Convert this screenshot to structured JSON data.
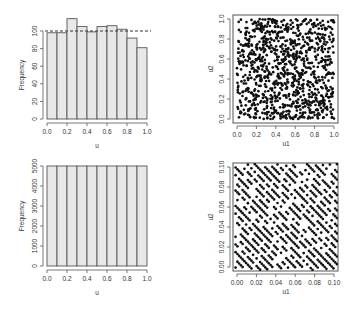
{
  "chart_data": [
    {
      "type": "bar",
      "panel": "top-left",
      "title": "",
      "xlabel": "u",
      "ylabel": "Frequency",
      "bin_edges": [
        0.0,
        0.1,
        0.2,
        0.3,
        0.4,
        0.5,
        0.6,
        0.7,
        0.8,
        0.9,
        1.0
      ],
      "categories": [
        "0.0-0.1",
        "0.1-0.2",
        "0.2-0.3",
        "0.3-0.4",
        "0.4-0.5",
        "0.5-0.6",
        "0.6-0.7",
        "0.7-0.8",
        "0.8-0.9",
        "0.9-1.0"
      ],
      "values": [
        98,
        98,
        114,
        105,
        99,
        105,
        106,
        102,
        92,
        81
      ],
      "reference_line": {
        "y": 100,
        "style": "dashed"
      },
      "xticks": [
        "0.0",
        "0.2",
        "0.4",
        "0.6",
        "0.8",
        "1.0"
      ],
      "yticks": [
        "0",
        "20",
        "40",
        "60",
        "80",
        "100"
      ],
      "xlim": [
        0,
        1
      ],
      "ylim": [
        0,
        114
      ],
      "grid": false,
      "bar_fill": "#e8e8e8",
      "bar_edge": "#555555"
    },
    {
      "type": "scatter",
      "panel": "top-right",
      "title": "",
      "xlabel": "u1",
      "ylabel": "u2",
      "description": "about 1000 points uniformly scattered over the unit square",
      "n_points": 1000,
      "generator_seed": 12345,
      "xticks": [
        "0.0",
        "0.2",
        "0.4",
        "0.6",
        "0.8",
        "1.0"
      ],
      "yticks": [
        "0.0",
        "0.2",
        "0.4",
        "0.6",
        "0.8",
        "1.0"
      ],
      "xlim": [
        0,
        1
      ],
      "ylim": [
        0,
        1
      ],
      "grid": false,
      "point_color": "#111111"
    },
    {
      "type": "bar",
      "panel": "bottom-left",
      "title": "",
      "xlabel": "u",
      "ylabel": "Frequency",
      "bin_edges": [
        0.0,
        0.1,
        0.2,
        0.3,
        0.4,
        0.5,
        0.6,
        0.7,
        0.8,
        0.9,
        1.0
      ],
      "categories": [
        "0.0-0.1",
        "0.1-0.2",
        "0.2-0.3",
        "0.3-0.4",
        "0.4-0.5",
        "0.5-0.6",
        "0.6-0.7",
        "0.7-0.8",
        "0.8-0.9",
        "0.9-1.0"
      ],
      "values": [
        5000,
        5000,
        5000,
        5000,
        5000,
        5000,
        5000,
        5000,
        5000,
        5000
      ],
      "xticks": [
        "0.0",
        "0.2",
        "0.4",
        "0.6",
        "0.8",
        "1.0"
      ],
      "yticks": [
        "0",
        "1000",
        "2000",
        "3000",
        "4000",
        "5000"
      ],
      "xlim": [
        0,
        1
      ],
      "ylim": [
        0,
        5000
      ],
      "grid": false,
      "bar_fill": "#e8e8e8",
      "bar_edge": "#555555"
    },
    {
      "type": "scatter",
      "panel": "bottom-right",
      "title": "",
      "xlabel": "u1",
      "ylabel": "u2",
      "description": "points lie on parallel diagonal lines (slope about -1), lattice structure of a generator zoomed to [0,0.1]x[0,0.1]",
      "lattice": {
        "line_spacing": 0.0077,
        "slope": -1,
        "point_step": 0.0018,
        "gap_probability": 0.25
      },
      "xticks": [
        "0.00",
        "0.02",
        "0.04",
        "0.06",
        "0.08",
        "0.10"
      ],
      "yticks": [
        "0.00",
        "0.02",
        "0.04",
        "0.06",
        "0.08",
        "0.10"
      ],
      "xlim": [
        0,
        0.1
      ],
      "ylim": [
        0,
        0.1
      ],
      "grid": false,
      "point_color": "#111111"
    }
  ],
  "labels": {
    "tl_xlabel": "u",
    "tl_ylabel": "Frequency",
    "tr_xlabel": "u1",
    "tr_ylabel": "u2",
    "bl_xlabel": "u",
    "bl_ylabel": "Frequency",
    "br_xlabel": "u1",
    "br_ylabel": "u2"
  }
}
